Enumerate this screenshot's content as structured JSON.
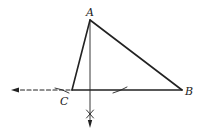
{
  "diagram": {
    "type": "geometric-construction",
    "points": {
      "A": {
        "label": "A",
        "x": 90,
        "y": 20
      },
      "B": {
        "label": "B",
        "x": 182,
        "y": 90
      },
      "C": {
        "label": "C",
        "x": 72,
        "y": 90
      }
    },
    "labels": [
      {
        "id": "A",
        "text": "A",
        "x": 86,
        "y": 7
      },
      {
        "id": "B",
        "text": "B",
        "x": 185,
        "y": 86
      },
      {
        "id": "C",
        "text": "C",
        "x": 60,
        "y": 96
      }
    ],
    "extension": {
      "from": [
        72,
        90
      ],
      "to": [
        12,
        90
      ],
      "style": "dashed-arrow"
    },
    "perpendicular": {
      "from": [
        90,
        20
      ],
      "to": [
        90,
        128
      ],
      "style": "arrow"
    },
    "colors": {
      "stroke": "#222222",
      "background": "#ffffff"
    }
  }
}
